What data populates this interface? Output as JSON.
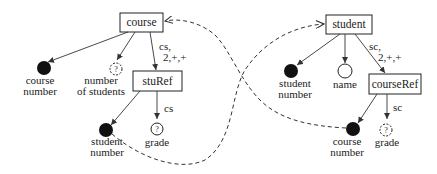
{
  "diagram": {
    "type": "schema-graph",
    "left": {
      "root": {
        "label": "course"
      },
      "leaf_course_number": {
        "label_line1": "course",
        "label_line2": "number",
        "kind": "filled"
      },
      "leaf_number_of_students": {
        "label_line1": "number",
        "label_line2": "of students",
        "kind": "optional",
        "symbol": "?"
      },
      "child": {
        "label": "stuRef"
      },
      "edge_label": {
        "line1": "cs,",
        "line2": "2,+,+"
      },
      "leaf_student_number": {
        "label_line1": "student",
        "label_line2": "number",
        "kind": "filled"
      },
      "leaf_grade": {
        "label": "grade",
        "kind": "optional",
        "symbol": "?"
      },
      "grade_edge_label": "cs"
    },
    "right": {
      "root": {
        "label": "student"
      },
      "leaf_student_number": {
        "label_line1": "student",
        "label_line2": "number",
        "kind": "filled"
      },
      "leaf_name": {
        "label": "name",
        "kind": "hollow"
      },
      "child": {
        "label": "courseRef"
      },
      "edge_label": {
        "line1": "sc,",
        "line2": "2,+,+"
      },
      "leaf_course_number": {
        "label_line1": "course",
        "label_line2": "number",
        "kind": "filled"
      },
      "leaf_grade": {
        "label": "grade",
        "kind": "optional",
        "symbol": "?"
      },
      "grade_edge_label": "sc"
    },
    "references": [
      {
        "from": "left.student number",
        "to": "right.student",
        "style": "dashed"
      },
      {
        "from": "right.course number",
        "to": "left.course",
        "style": "dashed"
      }
    ]
  }
}
